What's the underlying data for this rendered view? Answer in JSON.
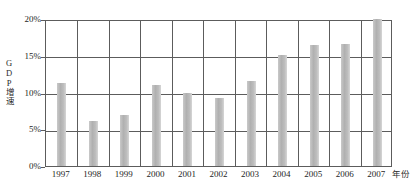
{
  "chart_data": {
    "type": "bar",
    "title": "",
    "xlabel": "年份",
    "ylabel": "GDP增速",
    "categories": [
      "1997",
      "1998",
      "1999",
      "2000",
      "2001",
      "2002",
      "2003",
      "2004",
      "2005",
      "2006",
      "2007"
    ],
    "values": [
      11.3,
      6.1,
      7.0,
      11.0,
      10.0,
      9.3,
      11.6,
      15.1,
      16.5,
      16.6,
      20.0
    ],
    "ytick_labels": [
      "20%",
      "15%",
      "10%",
      "5%",
      "0%"
    ],
    "ytick_values": [
      20,
      15,
      10,
      5,
      0
    ],
    "ylim": [
      0,
      20
    ],
    "grid": "both",
    "legend": "none",
    "series": [
      {
        "name": "GDP增速",
        "values": [
          11.3,
          6.1,
          7.0,
          11.0,
          10.0,
          9.3,
          11.6,
          15.1,
          16.5,
          16.6,
          20.0
        ]
      }
    ],
    "colors": {
      "bar": "#b8b8b8",
      "axis": "#5c5c5c",
      "grid": "#5c5c5c",
      "text": "#1e1e1e",
      "background": "#ffffff"
    }
  }
}
